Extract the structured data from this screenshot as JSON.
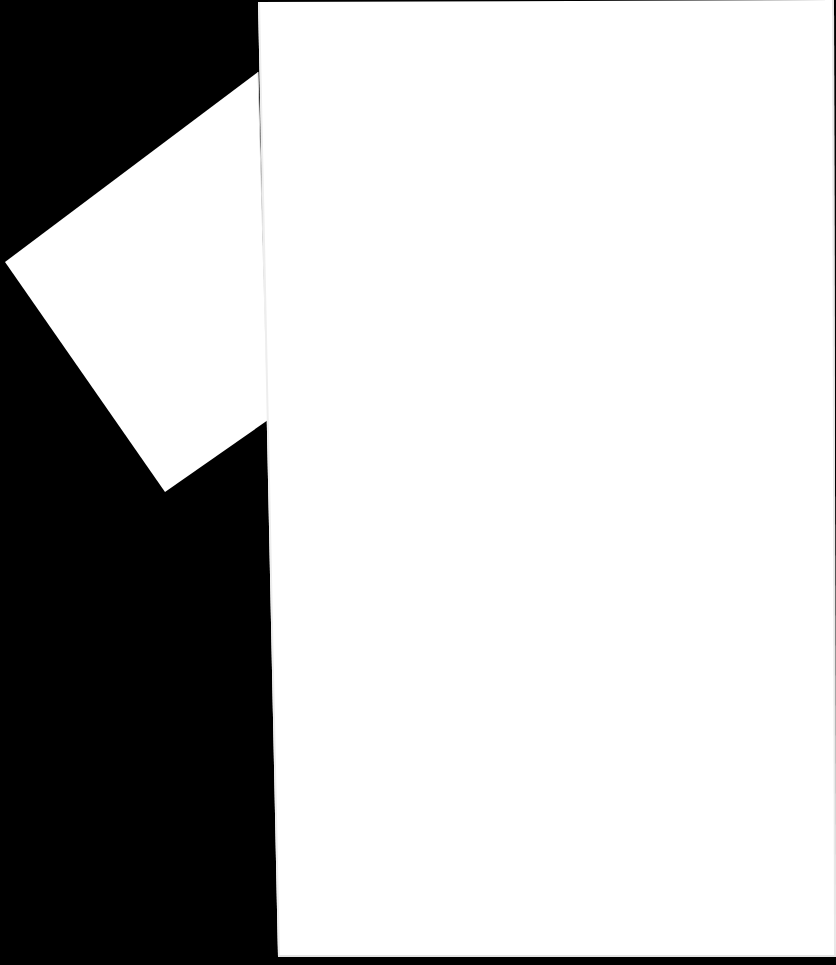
{
  "scene": {
    "description": "Two blank white paper sheets on a black background",
    "background_color": "#000000",
    "paper_color": "#ffffff",
    "edge_shadow_color": "#e6e6e6"
  },
  "sheets": [
    {
      "name": "tilted-sheet",
      "points": "258,72 5,262 165,492 268,420",
      "fill": "#ffffff"
    },
    {
      "name": "main-sheet",
      "points": "258,2 834,0 836,957 278,957",
      "fill": "#ffffff"
    }
  ]
}
